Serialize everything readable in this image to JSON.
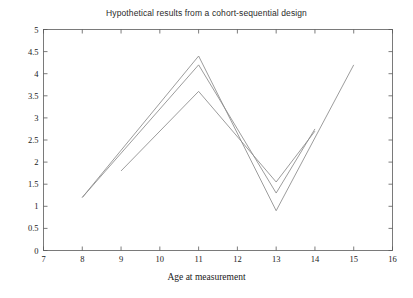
{
  "chart_data": {
    "type": "line",
    "title": "Hypothetical results from a cohort-sequential design",
    "xlabel": "Age at measurement",
    "ylabel": "",
    "xlim": [
      7,
      16
    ],
    "ylim": [
      0,
      5
    ],
    "xticks": [
      7,
      8,
      9,
      10,
      11,
      12,
      13,
      14,
      15,
      16
    ],
    "xtick_labels": [
      "7",
      "8",
      "9",
      "10",
      "11",
      "12",
      "13",
      "14",
      "15",
      "16"
    ],
    "yticks": [
      0,
      0.5,
      1,
      1.5,
      2,
      2.5,
      3,
      3.5,
      4,
      4.5,
      5
    ],
    "ytick_labels": [
      "0",
      "0.5",
      "1",
      "1.5",
      "2",
      "2.5",
      "3",
      "3.5",
      "4",
      "4.5",
      "5"
    ],
    "grid": false,
    "legend": "none",
    "line_color": "#8a8a8a",
    "background": "#ffffff",
    "series": [
      {
        "name": "cohort-1",
        "x": [
          8,
          11,
          13,
          15
        ],
        "y": [
          1.2,
          4.4,
          0.9,
          4.2
        ]
      },
      {
        "name": "cohort-2",
        "x": [
          8,
          11,
          13,
          14
        ],
        "y": [
          1.2,
          4.2,
          1.3,
          2.75
        ]
      },
      {
        "name": "cohort-3",
        "x": [
          9,
          11,
          13,
          14
        ],
        "y": [
          1.8,
          3.6,
          1.55,
          2.7
        ]
      }
    ]
  },
  "figure": {
    "title": "Hypothetical results from a cohort-sequential design",
    "xlabel": "Age at measurement"
  }
}
